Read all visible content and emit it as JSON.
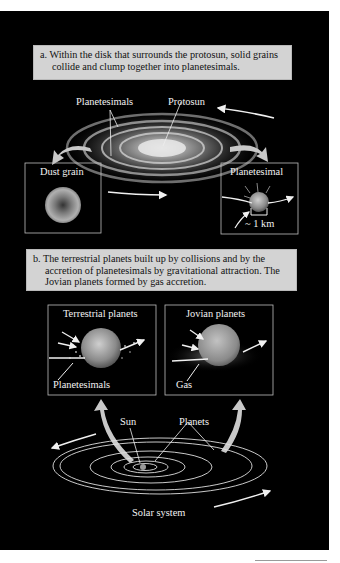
{
  "figure": {
    "panel_a": {
      "caption": "a. Within the disk that surrounds the protosun, solid grains collide and clump together into planetesimals.",
      "labels": {
        "planetesimals": "Planetesimals",
        "protosun": "Protosun",
        "dust_grain": "Dust grain",
        "planetesimal": "Planetesimal",
        "scale": "~ 1 km"
      }
    },
    "panel_b": {
      "caption": "b. The terrestrial planets built up by collisions and by the accretion of planetesimals by gravitational attraction. The Jovian planets formed by gas accretion.",
      "labels": {
        "terrestrial_planets": "Terrestrial planets",
        "terrestrial_planetesimals": "Planetesimals",
        "jovian_planets": "Jovian planets",
        "gas": "Gas",
        "sun": "Sun",
        "planets": "Planets",
        "solar_system": "Solar system"
      }
    },
    "colors": {
      "background": "#000000",
      "caption_fill": "#d3d3d3",
      "label_text": "#f2f2f2",
      "curved_arrow": "#c8c8c8"
    }
  }
}
